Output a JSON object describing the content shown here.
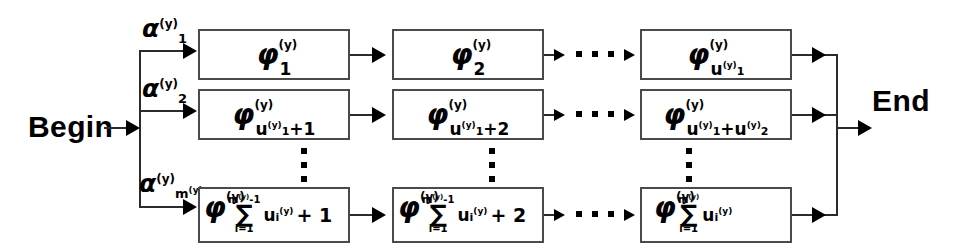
{
  "diagram": {
    "title_visible": false,
    "type": "phase-type-markov-chain-block-diagram",
    "colors": {
      "stroke": "#2b2b2b",
      "box_border": "#4a4a4a",
      "background": "#ffffff",
      "text": "#000000"
    },
    "endpoints": {
      "begin": "Begin",
      "end": "End"
    },
    "branch_labels": [
      {
        "base": "α",
        "sup": "(y)",
        "sub": "1",
        "sub_sup": ""
      },
      {
        "base": "α",
        "sup": "(y)",
        "sub": "2",
        "sub_sup": ""
      },
      {
        "base": "α",
        "sup": "(y)",
        "sub": "m",
        "sub_sup": "(y)"
      }
    ],
    "rows": [
      {
        "row_id": "row-1",
        "cells": [
          {
            "base": "φ",
            "sup": "(y)",
            "subscript_kind": "simple",
            "sub": "1",
            "sub_sup": ""
          },
          {
            "base": "φ",
            "sup": "(y)",
            "subscript_kind": "simple",
            "sub": "2",
            "sub_sup": ""
          },
          {
            "base": "φ",
            "sup": "(y)",
            "subscript_kind": "simple",
            "sub": "u",
            "sub_sub": "1",
            "sub_sup": "(y)"
          }
        ]
      },
      {
        "row_id": "row-2",
        "cells": [
          {
            "base": "φ",
            "sup": "(y)",
            "subscript_kind": "offset",
            "sub": "u",
            "sub_sub": "1",
            "sub_sup": "(y)",
            "offset": "+1"
          },
          {
            "base": "φ",
            "sup": "(y)",
            "subscript_kind": "offset",
            "sub": "u",
            "sub_sub": "1",
            "sub_sup": "(y)",
            "offset": "+2"
          },
          {
            "base": "φ",
            "sup": "(y)",
            "subscript_kind": "offset2",
            "sub": "u",
            "sub_sub": "1",
            "sub_sup": "(y)",
            "offset": "+u",
            "offset_sub": "2",
            "offset_sup": "(y)"
          }
        ]
      },
      {
        "row_id": "row-3",
        "cells": [
          {
            "base": "φ",
            "sup": "(y)",
            "subscript_kind": "sum",
            "sum_upper": "m",
            "sum_upper_sup": "(y)",
            "sum_upper_extra": "-1",
            "sum_lower": "i=1",
            "sum_body": "u",
            "sum_body_sub": "i",
            "sum_body_sup": "(y)",
            "offset": "+ 1"
          },
          {
            "base": "φ",
            "sup": "(y)",
            "subscript_kind": "sum",
            "sum_upper": "m",
            "sum_upper_sup": "(y)",
            "sum_upper_extra": "-1",
            "sum_lower": "i=1",
            "sum_body": "u",
            "sum_body_sub": "i",
            "sum_body_sup": "(y)",
            "offset": "+ 2"
          },
          {
            "base": "φ",
            "sup": "(y)",
            "subscript_kind": "sum",
            "sum_upper": "m",
            "sum_upper_sup": "(y)",
            "sum_upper_extra": "",
            "sum_lower": "i=1",
            "sum_body": "u",
            "sum_body_sub": "i",
            "sum_body_sup": "(y)",
            "offset": ""
          }
        ]
      }
    ],
    "ellipses": {
      "horizontal_between_col2_col3": "• • •",
      "vertical_between_row2_row3": "⋮"
    }
  }
}
